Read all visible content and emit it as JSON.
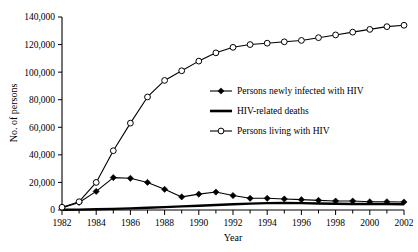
{
  "chart_data": {
    "type": "line",
    "title": "",
    "xlabel": "Year",
    "ylabel": "No. of persons",
    "xlim": [
      1982,
      2002
    ],
    "ylim": [
      0,
      140000
    ],
    "grid": false,
    "legend_position": "center-right-inside",
    "x_tick_labels": [
      "1982",
      "1984",
      "1986",
      "1988",
      "1990",
      "1992",
      "1994",
      "1996",
      "1998",
      "2000",
      "2002"
    ],
    "x_tick_values": [
      1982,
      1984,
      1986,
      1988,
      1990,
      1992,
      1994,
      1996,
      1998,
      2000,
      2002
    ],
    "x_minor_ticks": [
      1983,
      1985,
      1987,
      1989,
      1991,
      1993,
      1995,
      1997,
      1999,
      2001
    ],
    "y_tick_labels": [
      "0",
      "20,000",
      "40,000",
      "60,000",
      "80,000",
      "100,000",
      "120,000",
      "140,000"
    ],
    "y_tick_values": [
      0,
      20000,
      40000,
      60000,
      80000,
      100000,
      120000,
      140000
    ],
    "x": [
      1982,
      1983,
      1984,
      1985,
      1986,
      1987,
      1988,
      1989,
      1990,
      1991,
      1992,
      1993,
      1994,
      1995,
      1996,
      1997,
      1998,
      1999,
      2000,
      2001,
      2002
    ],
    "series": [
      {
        "name": "Persons newly infected with HIV",
        "marker": "filled-diamond",
        "values": [
          1500,
          5500,
          13500,
          23500,
          23000,
          20000,
          15000,
          9500,
          11500,
          13000,
          10500,
          8500,
          8500,
          8000,
          7500,
          7000,
          6500,
          6500,
          6000,
          6000,
          5800
        ]
      },
      {
        "name": "HIV-related deaths",
        "marker": "none",
        "values": [
          200,
          300,
          500,
          800,
          1200,
          1600,
          2100,
          2600,
          3100,
          3600,
          4200,
          4600,
          5000,
          5200,
          5000,
          4700,
          4500,
          4400,
          4300,
          4300,
          4200
        ]
      },
      {
        "name": "Persons living with HIV",
        "marker": "open-circle",
        "values": [
          2000,
          6000,
          20000,
          43000,
          63000,
          82000,
          94000,
          101000,
          108000,
          114000,
          118000,
          120000,
          121000,
          122000,
          123000,
          125000,
          127000,
          129000,
          131000,
          133000,
          134000
        ]
      }
    ]
  },
  "legend": {
    "items": [
      {
        "label": "Persons newly infected with HIV",
        "marker": "filled-diamond"
      },
      {
        "label": "HIV-related deaths",
        "marker": "plain-line"
      },
      {
        "label": "Persons living with HIV",
        "marker": "open-circle"
      }
    ]
  },
  "colors": {
    "axis": "#000000",
    "series": "#000000",
    "background": "#ffffff"
  }
}
